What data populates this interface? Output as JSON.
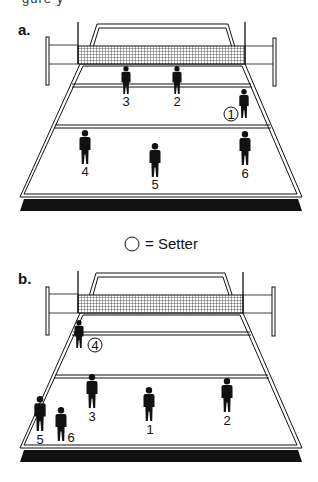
{
  "header": {
    "clipped_caption": "gure    y"
  },
  "legend": {
    "symbol": "circle",
    "text": "= Setter",
    "x": 132,
    "y": 244
  },
  "colors": {
    "ink": "#111111",
    "court_fill": "#ffffff",
    "base": "#111111",
    "net_mesh": "#333333"
  },
  "panels": [
    {
      "id": "a",
      "label": "a.",
      "label_pos": [
        18,
        35
      ],
      "offset_y": 0,
      "players": [
        {
          "number": "3",
          "x": 126,
          "top": 66,
          "h": 28,
          "label_x": 126,
          "label_y": 106,
          "setter": false
        },
        {
          "number": "2",
          "x": 177,
          "top": 66,
          "h": 28,
          "label_x": 177,
          "label_y": 106,
          "setter": false
        },
        {
          "number": "1",
          "x": 244,
          "top": 89,
          "h": 29,
          "label_x": 231,
          "label_y": 114,
          "setter": true
        },
        {
          "number": "4",
          "x": 85,
          "top": 130,
          "h": 34,
          "label_x": 85,
          "label_y": 176,
          "setter": false
        },
        {
          "number": "5",
          "x": 155,
          "top": 143,
          "h": 34,
          "label_x": 155,
          "label_y": 189,
          "setter": false
        },
        {
          "number": "6",
          "x": 245,
          "top": 131,
          "h": 34,
          "label_x": 245,
          "label_y": 178,
          "setter": false
        }
      ]
    },
    {
      "id": "b",
      "label": "b.",
      "label_pos": [
        18,
        284
      ],
      "offset_y": 250,
      "players": [
        {
          "number": "4",
          "x": 79,
          "top": 320,
          "h": 28,
          "label_x": 95,
          "label_y": 345,
          "setter": true
        },
        {
          "number": "3",
          "x": 92,
          "top": 374,
          "h": 34,
          "label_x": 92,
          "label_y": 421,
          "setter": false
        },
        {
          "number": "1",
          "x": 149,
          "top": 387,
          "h": 34,
          "label_x": 150,
          "label_y": 434,
          "setter": false
        },
        {
          "number": "2",
          "x": 227,
          "top": 378,
          "h": 34,
          "label_x": 227,
          "label_y": 425,
          "setter": false
        },
        {
          "number": "5",
          "x": 40,
          "top": 396,
          "h": 35,
          "label_x": 40,
          "label_y": 444,
          "setter": false
        },
        {
          "number": "6",
          "x": 61,
          "top": 407,
          "h": 34,
          "label_x": 71,
          "label_y": 442,
          "setter": false
        }
      ]
    }
  ]
}
